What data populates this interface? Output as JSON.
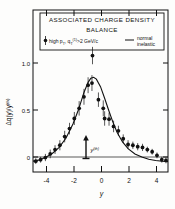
{
  "chart_data": {
    "type": "scatter",
    "title": "ASSOCIATED  CHARGE  DENSITY",
    "subtitle": "BALANCE",
    "xlabel": "y",
    "ylabel": "Δq(y)/y",
    "ylabel_sup": "(th)",
    "xlim": [
      -4.9,
      4.9
    ],
    "ylim": [
      -0.07,
      1.05
    ],
    "grid": false,
    "legend_position": "top-inside",
    "xticks": [
      -4,
      -2,
      0,
      2,
      4
    ],
    "xticklabels": [
      "-4",
      "-2",
      "0",
      "2",
      "4"
    ],
    "yticks": [
      0,
      0.5,
      1.0
    ],
    "yticklabels": [
      "0",
      "0.5",
      "1.0"
    ],
    "legend": [
      {
        "key": "data",
        "marker": "filled-circle-errorbar",
        "label": "high p",
        "label_sub": "T",
        "label_mid": ", q",
        "label_sup": "(1)",
        "label_end": ">2 GeV/c"
      },
      {
        "key": "curve",
        "marker": "solid-line",
        "label_line1": "normal",
        "label_line2": "inelastic"
      }
    ],
    "annotation": {
      "text": "y",
      "sup": "(th)",
      "arrow": "up-arrow",
      "x": -0.55,
      "y_from": -0.02,
      "y_to": 0.2
    },
    "series": [
      {
        "name": "high p_T, q_T^(1) > 2 GeV/c",
        "type": "scatter-errorbar",
        "marker": "filled-circle",
        "color": "#111111",
        "points": [
          {
            "x": -4.7,
            "y": 0.005,
            "yerr": 0.02
          },
          {
            "x": -4.35,
            "y": 0.015,
            "yerr": 0.02
          },
          {
            "x": -4.0,
            "y": 0.03,
            "yerr": 0.025
          },
          {
            "x": -3.65,
            "y": 0.055,
            "yerr": 0.03
          },
          {
            "x": -3.3,
            "y": 0.085,
            "yerr": 0.03
          },
          {
            "x": -2.95,
            "y": 0.115,
            "yerr": 0.035
          },
          {
            "x": -2.6,
            "y": 0.175,
            "yerr": 0.04
          },
          {
            "x": -2.25,
            "y": 0.23,
            "yerr": 0.04
          },
          {
            "x": -1.9,
            "y": 0.3,
            "yerr": 0.045
          },
          {
            "x": -1.55,
            "y": 0.37,
            "yerr": 0.05
          },
          {
            "x": -1.2,
            "y": 0.45,
            "yerr": 0.055
          },
          {
            "x": -0.9,
            "y": 0.53,
            "yerr": 0.055
          },
          {
            "x": -0.62,
            "y": 0.545,
            "yerr": 0.055
          },
          {
            "x": -0.58,
            "y": 0.735,
            "yerr": 0.06
          },
          {
            "x": -0.15,
            "y": 0.43,
            "yerr": 0.05
          },
          {
            "x": 0.2,
            "y": 0.37,
            "yerr": 0.055
          },
          {
            "x": 0.3,
            "y": 0.3,
            "yerr": 0.05
          },
          {
            "x": 0.62,
            "y": 0.295,
            "yerr": 0.045
          },
          {
            "x": 0.95,
            "y": 0.245,
            "yerr": 0.04
          },
          {
            "x": 1.3,
            "y": 0.215,
            "yerr": 0.035
          },
          {
            "x": 1.65,
            "y": 0.16,
            "yerr": 0.03
          },
          {
            "x": 2.0,
            "y": 0.12,
            "yerr": 0.03
          },
          {
            "x": 2.35,
            "y": 0.115,
            "yerr": 0.025
          },
          {
            "x": 2.7,
            "y": 0.105,
            "yerr": 0.025
          },
          {
            "x": 3.05,
            "y": 0.1,
            "yerr": 0.025
          },
          {
            "x": 3.4,
            "y": 0.085,
            "yerr": 0.02
          },
          {
            "x": 3.75,
            "y": 0.07,
            "yerr": 0.02
          },
          {
            "x": 4.1,
            "y": 0.045,
            "yerr": 0.02
          },
          {
            "x": 4.45,
            "y": 0.015,
            "yerr": 0.02
          },
          {
            "x": 4.75,
            "y": 0.01,
            "yerr": 0.02
          }
        ]
      },
      {
        "name": "normal inelastic",
        "type": "line",
        "color": "#111111",
        "x": [
          -4.9,
          -4.5,
          -4.0,
          -3.5,
          -3.0,
          -2.5,
          -2.0,
          -1.6,
          -1.2,
          -0.9,
          -0.7,
          -0.5,
          -0.3,
          0.0,
          0.3,
          0.6,
          0.9,
          1.2,
          1.6,
          2.0,
          2.5,
          3.0,
          3.5,
          4.0,
          4.5,
          4.9
        ],
        "y": [
          0.005,
          0.012,
          0.03,
          0.058,
          0.1,
          0.165,
          0.262,
          0.36,
          0.48,
          0.55,
          0.578,
          0.585,
          0.572,
          0.52,
          0.44,
          0.355,
          0.275,
          0.205,
          0.138,
          0.092,
          0.055,
          0.033,
          0.018,
          0.01,
          0.004,
          0.002
        ]
      }
    ]
  }
}
